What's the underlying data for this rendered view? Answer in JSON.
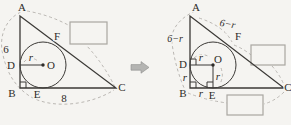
{
  "colors": {
    "background": "#f5f4f1",
    "line": "#3b3936",
    "dashed_line": "#b3b0ab",
    "box_border": "#a9a6a1",
    "arrow_fill": "#b4b4b2",
    "text": "#2e2c29"
  },
  "points": {
    "a": "A",
    "b": "B",
    "c": "C",
    "d": "D",
    "e": "E",
    "f": "F",
    "o": "O"
  },
  "left_figure": {
    "side_ab": "6",
    "side_bc": "8",
    "radius": "r"
  },
  "right_figure": {
    "segment_ad": "6−r",
    "segment_af": "6−r",
    "radius_do": "r",
    "radius_oe": "r",
    "segment_db": "r",
    "segment_be": "r"
  }
}
